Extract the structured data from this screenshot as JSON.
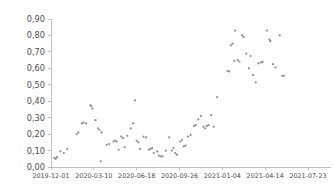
{
  "chart_data": {
    "type": "scatter",
    "title": "",
    "subtitle": "",
    "xlabel": "",
    "ylabel": "",
    "grid": false,
    "legend": null,
    "marker": {
      "shape": "circle",
      "color": "#8c8c8c",
      "size_px": 2.2
    },
    "decimal_separator": ",",
    "ylim": [
      0.0,
      0.9
    ],
    "yticks": [
      0.0,
      0.1,
      0.2,
      0.3,
      0.4,
      0.5,
      0.6,
      0.7,
      0.8,
      0.9
    ],
    "ytick_labels": [
      "0,00",
      "0,10",
      "0,20",
      "0,30",
      "0,40",
      "0,50",
      "0,60",
      "0,70",
      "0,80",
      "0,90"
    ],
    "xlim": [
      "2019-12-01",
      "2021-08-20"
    ],
    "xticks": [
      "2019-12-01",
      "2020-03-10",
      "2020-06-18",
      "2020-09-26",
      "2021-01-04",
      "2021-04-14",
      "2021-07-23"
    ],
    "xtick_labels": [
      "2019-12-01",
      "2020-03-10",
      "2020-06-18",
      "2020-09-26",
      "2021-01-04",
      "2021-04-14",
      "2021-07-23"
    ],
    "x_unit": "days_since_2019-12-01",
    "x_tick_days": [
      0,
      100,
      200,
      300,
      400,
      500,
      600
    ],
    "points": [
      {
        "x": 8,
        "y": 0.055
      },
      {
        "x": 11,
        "y": 0.05
      },
      {
        "x": 14,
        "y": 0.06
      },
      {
        "x": 22,
        "y": 0.095
      },
      {
        "x": 30,
        "y": 0.085
      },
      {
        "x": 38,
        "y": 0.11
      },
      {
        "x": 60,
        "y": 0.2
      },
      {
        "x": 64,
        "y": 0.21
      },
      {
        "x": 72,
        "y": 0.265
      },
      {
        "x": 76,
        "y": 0.27
      },
      {
        "x": 82,
        "y": 0.265
      },
      {
        "x": 92,
        "y": 0.375
      },
      {
        "x": 94,
        "y": 0.37
      },
      {
        "x": 97,
        "y": 0.355
      },
      {
        "x": 104,
        "y": 0.285
      },
      {
        "x": 110,
        "y": 0.235
      },
      {
        "x": 113,
        "y": 0.225
      },
      {
        "x": 118,
        "y": 0.21
      },
      {
        "x": 116,
        "y": 0.035
      },
      {
        "x": 130,
        "y": 0.135
      },
      {
        "x": 136,
        "y": 0.14
      },
      {
        "x": 146,
        "y": 0.155
      },
      {
        "x": 150,
        "y": 0.16
      },
      {
        "x": 153,
        "y": 0.155
      },
      {
        "x": 158,
        "y": 0.105
      },
      {
        "x": 164,
        "y": 0.185
      },
      {
        "x": 168,
        "y": 0.175
      },
      {
        "x": 172,
        "y": 0.12
      },
      {
        "x": 178,
        "y": 0.19
      },
      {
        "x": 186,
        "y": 0.235
      },
      {
        "x": 196,
        "y": 0.405
      },
      {
        "x": 192,
        "y": 0.265
      },
      {
        "x": 200,
        "y": 0.16
      },
      {
        "x": 204,
        "y": 0.15
      },
      {
        "x": 208,
        "y": 0.11
      },
      {
        "x": 216,
        "y": 0.185
      },
      {
        "x": 222,
        "y": 0.18
      },
      {
        "x": 228,
        "y": 0.105
      },
      {
        "x": 232,
        "y": 0.11
      },
      {
        "x": 236,
        "y": 0.115
      },
      {
        "x": 240,
        "y": 0.085
      },
      {
        "x": 248,
        "y": 0.095
      },
      {
        "x": 252,
        "y": 0.07
      },
      {
        "x": 256,
        "y": 0.065
      },
      {
        "x": 260,
        "y": 0.065
      },
      {
        "x": 268,
        "y": 0.1
      },
      {
        "x": 276,
        "y": 0.18
      },
      {
        "x": 282,
        "y": 0.1
      },
      {
        "x": 286,
        "y": 0.115
      },
      {
        "x": 290,
        "y": 0.085
      },
      {
        "x": 294,
        "y": 0.075
      },
      {
        "x": 302,
        "y": 0.155
      },
      {
        "x": 306,
        "y": 0.165
      },
      {
        "x": 310,
        "y": 0.125
      },
      {
        "x": 314,
        "y": 0.13
      },
      {
        "x": 320,
        "y": 0.185
      },
      {
        "x": 326,
        "y": 0.195
      },
      {
        "x": 334,
        "y": 0.25
      },
      {
        "x": 338,
        "y": 0.255
      },
      {
        "x": 344,
        "y": 0.29
      },
      {
        "x": 350,
        "y": 0.31
      },
      {
        "x": 356,
        "y": 0.245
      },
      {
        "x": 360,
        "y": 0.235
      },
      {
        "x": 364,
        "y": 0.25
      },
      {
        "x": 368,
        "y": 0.255
      },
      {
        "x": 374,
        "y": 0.315
      },
      {
        "x": 380,
        "y": 0.245
      },
      {
        "x": 388,
        "y": 0.425
      },
      {
        "x": 412,
        "y": 0.585
      },
      {
        "x": 416,
        "y": 0.58
      },
      {
        "x": 420,
        "y": 0.74
      },
      {
        "x": 424,
        "y": 0.75
      },
      {
        "x": 430,
        "y": 0.83
      },
      {
        "x": 428,
        "y": 0.645
      },
      {
        "x": 436,
        "y": 0.65
      },
      {
        "x": 440,
        "y": 0.64
      },
      {
        "x": 446,
        "y": 0.8
      },
      {
        "x": 450,
        "y": 0.79
      },
      {
        "x": 456,
        "y": 0.69
      },
      {
        "x": 462,
        "y": 0.6
      },
      {
        "x": 466,
        "y": 0.675
      },
      {
        "x": 472,
        "y": 0.56
      },
      {
        "x": 478,
        "y": 0.515
      },
      {
        "x": 484,
        "y": 0.63
      },
      {
        "x": 490,
        "y": 0.635
      },
      {
        "x": 494,
        "y": 0.64
      },
      {
        "x": 504,
        "y": 0.83
      },
      {
        "x": 510,
        "y": 0.775
      },
      {
        "x": 512,
        "y": 0.765
      },
      {
        "x": 518,
        "y": 0.625
      },
      {
        "x": 524,
        "y": 0.605
      },
      {
        "x": 534,
        "y": 0.8
      },
      {
        "x": 540,
        "y": 0.555
      },
      {
        "x": 544,
        "y": 0.555
      }
    ]
  }
}
